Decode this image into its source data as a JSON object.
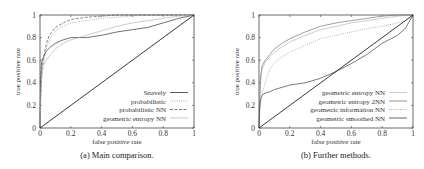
{
  "chart_data": [
    {
      "type": "line",
      "title": "",
      "caption": "(a) Main comparison.",
      "xlabel": "false positive rate",
      "ylabel": "true positive rate",
      "xlim": [
        0,
        1
      ],
      "ylim": [
        0,
        1
      ],
      "xticks": [
        "0",
        "0.2",
        "0.4",
        "0.6",
        "0.8",
        "1"
      ],
      "yticks": [
        "0",
        "0.2",
        "0.4",
        "0.6",
        "0.8",
        "1"
      ],
      "grid": false,
      "legend_position": "lower right",
      "series": [
        {
          "name": "Snavely",
          "style": "solid",
          "color": "#333333",
          "x": [
            0,
            0.005,
            0.01,
            0.02,
            0.04,
            0.07,
            0.1,
            0.15,
            0.2,
            0.3,
            0.4,
            0.5,
            0.6,
            0.7,
            0.8,
            0.9,
            1.0
          ],
          "y": [
            0,
            0.45,
            0.58,
            0.62,
            0.68,
            0.72,
            0.75,
            0.78,
            0.8,
            0.8,
            0.82,
            0.85,
            0.87,
            0.89,
            0.93,
            0.97,
            1.0
          ]
        },
        {
          "name": "probabilistic",
          "style": "dotted",
          "color": "#999999",
          "x": [
            0,
            0.005,
            0.01,
            0.02,
            0.04,
            0.06,
            0.1,
            0.15,
            0.2,
            0.3,
            0.4,
            0.5,
            0.6,
            0.7,
            0.8,
            0.9,
            1.0
          ],
          "y": [
            0,
            0.3,
            0.45,
            0.55,
            0.7,
            0.78,
            0.86,
            0.9,
            0.93,
            0.95,
            0.97,
            0.98,
            0.99,
            1.0,
            1.0,
            1.0,
            1.0
          ]
        },
        {
          "name": "probabilistic NN",
          "style": "dashed",
          "color": "#555555",
          "x": [
            0,
            0.005,
            0.01,
            0.02,
            0.04,
            0.06,
            0.1,
            0.15,
            0.2,
            0.3,
            0.4,
            0.5,
            0.6,
            0.7,
            0.8,
            0.9,
            1.0
          ],
          "y": [
            0,
            0.35,
            0.5,
            0.6,
            0.74,
            0.82,
            0.89,
            0.93,
            0.96,
            0.98,
            0.99,
            1.0,
            1.0,
            1.0,
            1.0,
            1.0,
            1.0
          ]
        },
        {
          "name": "geometric entropy NN",
          "style": "solid-light",
          "color": "#aaaaaa",
          "x": [
            0,
            0.005,
            0.01,
            0.02,
            0.04,
            0.07,
            0.1,
            0.15,
            0.2,
            0.3,
            0.4,
            0.5,
            0.6,
            0.7,
            0.8,
            0.9,
            1.0
          ],
          "y": [
            0,
            0.28,
            0.42,
            0.55,
            0.6,
            0.65,
            0.7,
            0.75,
            0.78,
            0.82,
            0.86,
            0.9,
            0.93,
            0.95,
            0.97,
            0.99,
            1.0
          ]
        },
        {
          "name": "diagonal",
          "style": "solid",
          "color": "#222222",
          "x": [
            0,
            1
          ],
          "y": [
            0,
            1
          ]
        }
      ]
    },
    {
      "type": "line",
      "title": "",
      "caption": "(b) Further methods.",
      "xlabel": "false positive rate",
      "ylabel": "true positive rate",
      "xlim": [
        0,
        1
      ],
      "ylim": [
        0,
        1
      ],
      "xticks": [
        "0",
        "0.2",
        "0.4",
        "0.6",
        "0.8",
        "1"
      ],
      "yticks": [
        "0",
        "0.2",
        "0.4",
        "0.6",
        "0.8",
        "1"
      ],
      "grid": false,
      "legend_position": "lower right",
      "series": [
        {
          "name": "geometric entropy NN",
          "style": "solid-light",
          "color": "#aaaaaa",
          "x": [
            0,
            0.005,
            0.01,
            0.02,
            0.04,
            0.07,
            0.1,
            0.15,
            0.2,
            0.3,
            0.4,
            0.5,
            0.6,
            0.7,
            0.8,
            0.9,
            1.0
          ],
          "y": [
            0,
            0.25,
            0.4,
            0.52,
            0.58,
            0.63,
            0.67,
            0.72,
            0.76,
            0.82,
            0.87,
            0.9,
            0.93,
            0.95,
            0.97,
            0.99,
            1.0
          ]
        },
        {
          "name": "geometric entropy 2NN",
          "style": "solid",
          "color": "#777777",
          "x": [
            0,
            0.005,
            0.01,
            0.02,
            0.04,
            0.07,
            0.1,
            0.15,
            0.2,
            0.3,
            0.4,
            0.5,
            0.6,
            0.7,
            0.8,
            0.9,
            1.0
          ],
          "y": [
            0,
            0.3,
            0.45,
            0.55,
            0.6,
            0.65,
            0.7,
            0.75,
            0.79,
            0.85,
            0.9,
            0.93,
            0.95,
            0.97,
            0.99,
            1.0,
            1.0
          ]
        },
        {
          "name": "geometric information NN",
          "style": "dotted",
          "color": "#999999",
          "x": [
            0,
            0.005,
            0.01,
            0.02,
            0.04,
            0.07,
            0.1,
            0.15,
            0.2,
            0.3,
            0.4,
            0.5,
            0.6,
            0.7,
            0.8,
            0.9,
            0.95,
            1.0
          ],
          "y": [
            0,
            0.15,
            0.22,
            0.3,
            0.4,
            0.52,
            0.58,
            0.63,
            0.67,
            0.73,
            0.79,
            0.82,
            0.85,
            0.88,
            0.9,
            0.93,
            0.95,
            1.0
          ]
        },
        {
          "name": "geometric smoothed NN",
          "style": "solid",
          "color": "#444444",
          "x": [
            0,
            0.005,
            0.01,
            0.02,
            0.04,
            0.07,
            0.1,
            0.15,
            0.2,
            0.3,
            0.4,
            0.5,
            0.6,
            0.7,
            0.8,
            0.9,
            0.95,
            1.0
          ],
          "y": [
            0,
            0.2,
            0.25,
            0.29,
            0.31,
            0.32,
            0.34,
            0.36,
            0.38,
            0.4,
            0.44,
            0.5,
            0.57,
            0.65,
            0.75,
            0.82,
            0.88,
            1.0
          ]
        },
        {
          "name": "diagonal",
          "style": "solid",
          "color": "#222222",
          "x": [
            0,
            1
          ],
          "y": [
            0,
            1
          ]
        }
      ]
    }
  ],
  "charts": {
    "a": {
      "caption": "(a) Main comparison.",
      "xlabel": "false positive rate",
      "ylabel": "true positive rate",
      "legend": [
        "Snavely",
        "probabilistic",
        "probabilistic NN",
        "geometric entropy NN"
      ]
    },
    "b": {
      "caption": "(b) Further methods.",
      "xlabel": "false positive rate",
      "ylabel": "true positive rate",
      "legend": [
        "geometric entropy NN",
        "geometric entropy 2NN",
        "geometric information NN",
        "geometric smoothed NN"
      ]
    }
  }
}
